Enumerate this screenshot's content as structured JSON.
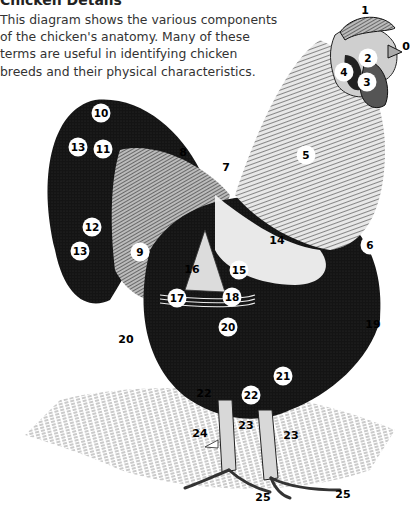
{
  "header": {
    "title": "Chicken Details",
    "description": "This diagram shows the various components of the chicken's anatomy. Many of these terms are useful in identifying chicken breeds and their physical characteristics."
  },
  "diagram": {
    "labels": [
      {
        "id": "0",
        "text": "0",
        "style": "plain"
      },
      {
        "id": "1",
        "text": "1",
        "style": "plain"
      },
      {
        "id": "2",
        "text": "2",
        "style": "circle"
      },
      {
        "id": "3",
        "text": "3",
        "style": "circle"
      },
      {
        "id": "4",
        "text": "4",
        "style": "circle"
      },
      {
        "id": "5",
        "text": "5",
        "style": "circle"
      },
      {
        "id": "6",
        "text": "6",
        "style": "circle"
      },
      {
        "id": "7",
        "text": "7",
        "style": "plain"
      },
      {
        "id": "8",
        "text": "8",
        "style": "plain"
      },
      {
        "id": "9",
        "text": "9",
        "style": "circle"
      },
      {
        "id": "10",
        "text": "10",
        "style": "circle"
      },
      {
        "id": "11",
        "text": "11",
        "style": "circle"
      },
      {
        "id": "12",
        "text": "12",
        "style": "circle"
      },
      {
        "id": "13a",
        "text": "13",
        "style": "circle"
      },
      {
        "id": "13b",
        "text": "13",
        "style": "circle"
      },
      {
        "id": "14",
        "text": "14",
        "style": "plain"
      },
      {
        "id": "15",
        "text": "15",
        "style": "circle"
      },
      {
        "id": "16",
        "text": "16",
        "style": "plain"
      },
      {
        "id": "17",
        "text": "17",
        "style": "circle"
      },
      {
        "id": "18",
        "text": "18",
        "style": "circle"
      },
      {
        "id": "19",
        "text": "19",
        "style": "plain"
      },
      {
        "id": "20a",
        "text": "20",
        "style": "plain"
      },
      {
        "id": "20b",
        "text": "20",
        "style": "circle"
      },
      {
        "id": "21",
        "text": "21",
        "style": "circle"
      },
      {
        "id": "22a",
        "text": "22",
        "style": "plain"
      },
      {
        "id": "22b",
        "text": "22",
        "style": "circle"
      },
      {
        "id": "23a",
        "text": "23",
        "style": "plain"
      },
      {
        "id": "23b",
        "text": "23",
        "style": "plain"
      },
      {
        "id": "24",
        "text": "24",
        "style": "plain"
      },
      {
        "id": "25a",
        "text": "25",
        "style": "plain"
      },
      {
        "id": "25b",
        "text": "25",
        "style": "plain"
      }
    ]
  }
}
